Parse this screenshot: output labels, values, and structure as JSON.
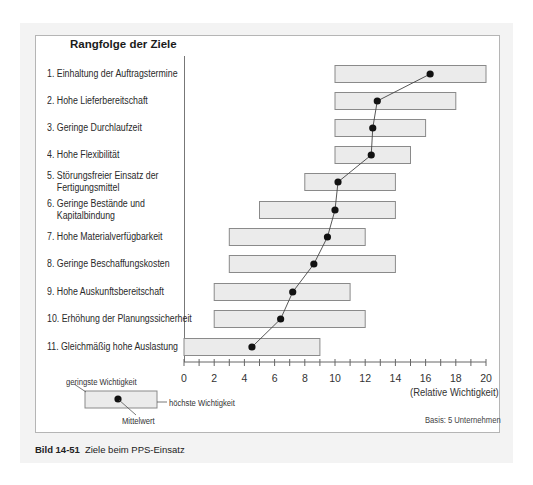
{
  "chart_data": {
    "type": "range-bar",
    "title": "Rangfolge der Ziele",
    "xlabel": "(Relative Wichtigkeit)",
    "xlim": [
      0,
      20
    ],
    "xticks": [
      0,
      2,
      4,
      6,
      8,
      10,
      12,
      14,
      16,
      18,
      20
    ],
    "minor_ticks_every": 1,
    "grid": false,
    "categories": [
      "1. Einhaltung der Auftragstermine",
      "2. Hohe Lieferbereitschaft",
      "3. Geringe Durchlaufzeit",
      "4. Hohe Flexibilität",
      "5. Störungsfreier Einsatz der Fertigungsmittel",
      "6. Geringe Bestände und Kapitalbindung",
      "7. Hohe Materialverfügbarkeit",
      "8. Geringe Beschaffungskosten",
      "9. Hohe Auskunftsbereitschaft",
      "10. Erhöhung der Planungssicherheit",
      "11. Gleichmäßig hohe Auslastung"
    ],
    "series": [
      {
        "name": "geringste Wichtigkeit",
        "values": [
          10,
          10,
          10,
          10,
          8,
          5,
          3,
          3,
          2,
          2,
          0
        ]
      },
      {
        "name": "höchste Wichtigkeit",
        "values": [
          20,
          18,
          16,
          15,
          14,
          14,
          12,
          14,
          11,
          12,
          9
        ]
      },
      {
        "name": "Mittelwert",
        "values": [
          16.3,
          12.8,
          12.5,
          12.4,
          10.2,
          10.0,
          9.5,
          8.6,
          7.2,
          6.4,
          4.5
        ]
      }
    ],
    "note": "Basis: 5 Unternehmen",
    "legend_position": "bottom-left"
  },
  "chart": {
    "title": "Rangfolge der Ziele",
    "goals": [
      {
        "lines": [
          "1. Einhaltung der Auftragstermine"
        ]
      },
      {
        "lines": [
          "2. Hohe Lieferbereitschaft"
        ]
      },
      {
        "lines": [
          "3. Geringe Durchlaufzeit"
        ]
      },
      {
        "lines": [
          "4. Hohe Flexibilität"
        ]
      },
      {
        "lines": [
          "5. Störungsfreier Einsatz der",
          "    Fertigungsmittel"
        ]
      },
      {
        "lines": [
          "6. Geringe Bestände und",
          "    Kapitalbindung"
        ]
      },
      {
        "lines": [
          "7. Hohe Materialverfügbarkeit"
        ]
      },
      {
        "lines": [
          "8. Geringe Beschaffungskosten"
        ]
      },
      {
        "lines": [
          "9. Hohe Auskunftsbereitschaft"
        ]
      },
      {
        "lines": [
          "10. Erhöhung der Planungssicherheit"
        ]
      },
      {
        "lines": [
          "11. Gleichmäßig hohe Auslastung"
        ]
      }
    ],
    "tick_labels": [
      "0",
      "2",
      "4",
      "6",
      "8",
      "10",
      "12",
      "14",
      "16",
      "18",
      "20"
    ],
    "axis_title": "(Relative Wichtigkeit)",
    "basis": "Basis: 5 Unternehmen",
    "legend": {
      "min_label": "geringste Wichtigkeit",
      "max_label": "höchste Wichtigkeit",
      "mean_label": "Mittelwert"
    },
    "colors": {
      "bar_fill": "#ebebeb",
      "bar_border": "#8a8a8a",
      "dot": "#111111",
      "line": "#444444",
      "panel": "#f3f3f3"
    }
  },
  "caption": {
    "figure_number": "Bild 14-51",
    "text": "Ziele beim PPS-Einsatz"
  }
}
